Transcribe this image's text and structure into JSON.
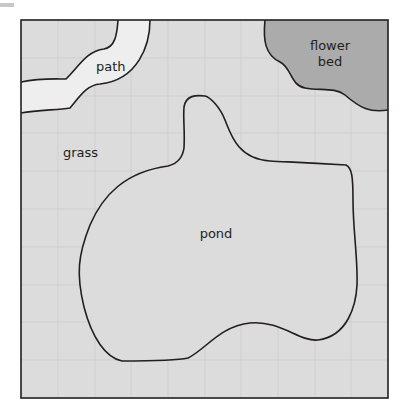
{
  "diagram": {
    "type": "garden-map",
    "colors": {
      "grass": "#dcdcdc",
      "path": "#eeeeee",
      "flower_bed": "#ababab",
      "grid": "#cfcfcf",
      "outline": "#231f20"
    },
    "grid": {
      "cols": 10,
      "rows": 10
    },
    "labels": {
      "path": "path",
      "flower_bed_line1": "flower",
      "flower_bed_line2": "bed",
      "grass": "grass",
      "pond": "pond"
    }
  }
}
